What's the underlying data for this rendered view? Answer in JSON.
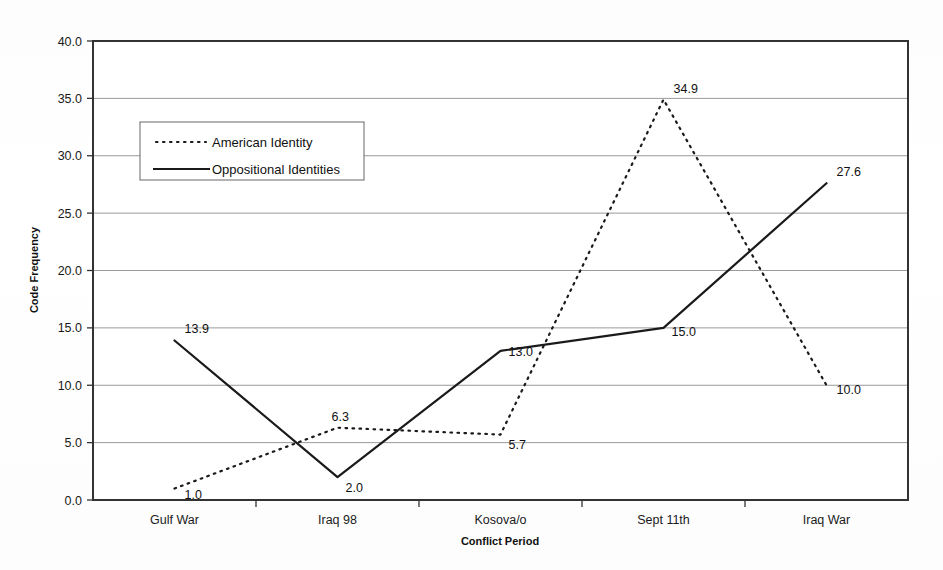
{
  "chart_data": {
    "type": "line",
    "title": "",
    "xlabel": "Conflict Period",
    "ylabel": "Code Frequency",
    "categories": [
      "Gulf War",
      "Iraq 98",
      "Kosova/o",
      "Sept 11th",
      "Iraq War"
    ],
    "ylim": [
      0,
      40
    ],
    "ytick_step": 5,
    "ytick_labels": [
      "0.0",
      "5.0",
      "10.0",
      "15.0",
      "20.0",
      "25.0",
      "30.0",
      "35.0",
      "40.0"
    ],
    "ytick_values": [
      0,
      5,
      10,
      15,
      20,
      25,
      30,
      35,
      40
    ],
    "grid": true,
    "grid_axis": "y",
    "legend_position": "upper-left-inside",
    "series": [
      {
        "name": "American Identity",
        "style": "dotted",
        "color": "#1a1a1a",
        "values": [
          1.0,
          6.3,
          5.7,
          34.9,
          10.0
        ],
        "value_labels": [
          "1.0",
          "6.3",
          "5.7",
          "34.9",
          "10.0"
        ]
      },
      {
        "name": "Oppositional Identities",
        "style": "solid",
        "color": "#1a1a1a",
        "values": [
          13.9,
          2.0,
          13.0,
          15.0,
          27.6
        ],
        "value_labels": [
          "13.9",
          "2.0",
          "13.0",
          "15.0",
          "27.6"
        ]
      }
    ]
  },
  "legend": {
    "entries": [
      {
        "label": "American Identity",
        "style": "dotted"
      },
      {
        "label": "Oppositional Identities",
        "style": "solid"
      }
    ]
  },
  "colors": {
    "ink": "#1a1a1a",
    "grid": "#9a9a9a",
    "axis": "#333333",
    "background": "#ffffff"
  }
}
